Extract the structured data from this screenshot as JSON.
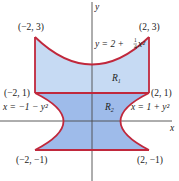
{
  "figure": {
    "axes": {
      "x_label": "x",
      "y_label": "y"
    },
    "colors": {
      "boundary": "#c0283c",
      "region_r1_fill": "#c6daf3",
      "region_r2_fill": "#9ebbea",
      "axis": "#4a4a4a"
    },
    "points": [
      {
        "label": "(−2, 3)",
        "x": -2,
        "y": 3
      },
      {
        "label": "(2, 3)",
        "x": 2,
        "y": 3
      },
      {
        "label": "(−2, 1)",
        "x": -2,
        "y": 1
      },
      {
        "label": "(2, 1)",
        "x": 2,
        "y": 1
      },
      {
        "label": "(−2, −1)",
        "x": -2,
        "y": -1
      },
      {
        "label": "(2, −1)",
        "x": 2,
        "y": -1
      }
    ],
    "curves": {
      "top": {
        "label_prefix": "y = 2 + ",
        "frac_num": "1",
        "frac_den": "4",
        "label_suffix": "x²"
      },
      "left": {
        "label": "x = −1 − y²"
      },
      "right": {
        "label": "x = 1 + y²"
      }
    },
    "regions": [
      {
        "name": "R",
        "sub": "1"
      },
      {
        "name": "R",
        "sub": "2"
      }
    ]
  }
}
